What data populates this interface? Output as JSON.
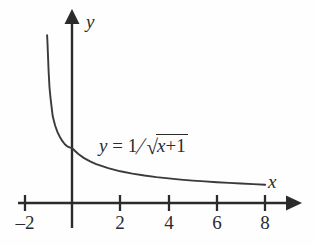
{
  "figure": {
    "kind": "cartesian-plot",
    "background_color": "#fefefe",
    "ink_color": "#2b2b2b",
    "axis_labels": {
      "x": "x",
      "y": "y"
    },
    "equation_label": {
      "lhs": "y",
      "equals": "=",
      "numerator": "1",
      "slash": "/",
      "radicand_first": "x",
      "radicand_op": "+",
      "radicand_second": "1",
      "plain_text": "y = 1/√(x + 1)"
    }
  },
  "chart_data": {
    "type": "line",
    "title": "",
    "xlabel": "x",
    "ylabel": "y",
    "grid": false,
    "legend": null,
    "xlim": [
      -2.3,
      9.0
    ],
    "ylim": [
      -0.4,
      3.5
    ],
    "xticks": [
      -2,
      2,
      4,
      6,
      8
    ],
    "xticklabels": [
      "–2",
      "2",
      "4",
      "6",
      "8"
    ],
    "yticks": [],
    "yticklabels": [],
    "annotations": [
      {
        "text": "y = 1/√(x + 1)",
        "x": 1.2,
        "y": 1.02
      }
    ],
    "series": [
      {
        "name": "y = 1/sqrt(x+1)",
        "formula": "1/sqrt(x+1)",
        "domain": [
          -1.03,
          8.0
        ],
        "x": [
          -1.03,
          -1.02,
          -1.0,
          -0.97,
          -0.93,
          -0.88,
          -0.8,
          -0.7,
          -0.6,
          -0.5,
          -0.4,
          -0.3,
          -0.2,
          -0.1,
          0.0,
          0.25,
          0.5,
          0.75,
          1.0,
          1.5,
          2.0,
          2.5,
          3.0,
          3.5,
          4.0,
          4.5,
          5.0,
          5.5,
          6.0,
          6.5,
          7.0,
          7.5,
          8.0
        ],
        "y": [
          3.05,
          2.95,
          2.72,
          2.4,
          2.1,
          1.88,
          1.58,
          1.41,
          1.29,
          1.2,
          1.13,
          1.07,
          1.03,
          1.01,
          1.0,
          0.894,
          0.816,
          0.756,
          0.707,
          0.632,
          0.577,
          0.535,
          0.5,
          0.471,
          0.447,
          0.426,
          0.408,
          0.392,
          0.378,
          0.365,
          0.354,
          0.343,
          0.333
        ]
      }
    ]
  }
}
